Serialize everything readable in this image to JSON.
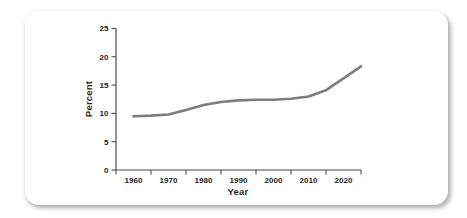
{
  "chart_data": {
    "type": "line",
    "title": "",
    "xlabel": "Year",
    "ylabel": "Percent",
    "x_tick_labels": [
      "1960",
      "1970",
      "1980",
      "1990",
      "2000",
      "2010",
      "2020"
    ],
    "x_axis_tick_years": [
      1955,
      1965,
      1975,
      1985,
      1995,
      2005,
      2015,
      2025
    ],
    "y_ticks": [
      "0",
      "5",
      "10",
      "15",
      "20",
      "25"
    ],
    "xlim": [
      1955,
      2025
    ],
    "ylim": [
      0,
      25
    ],
    "grid": false,
    "legend": "none",
    "axis_color": "#4b4b4d",
    "text_color": "#232323",
    "series": [
      {
        "name": "Percent",
        "color": "#7c7d80",
        "points": [
          {
            "x": 1960,
            "y": 9.5
          },
          {
            "x": 1965,
            "y": 9.6
          },
          {
            "x": 1970,
            "y": 9.8
          },
          {
            "x": 1975,
            "y": 10.6
          },
          {
            "x": 1980,
            "y": 11.5
          },
          {
            "x": 1985,
            "y": 12.0
          },
          {
            "x": 1990,
            "y": 12.3
          },
          {
            "x": 1995,
            "y": 12.4
          },
          {
            "x": 2000,
            "y": 12.4
          },
          {
            "x": 2005,
            "y": 12.6
          },
          {
            "x": 2010,
            "y": 13.0
          },
          {
            "x": 2015,
            "y": 14.1
          },
          {
            "x": 2020,
            "y": 16.2
          },
          {
            "x": 2025,
            "y": 18.3
          }
        ]
      }
    ]
  }
}
